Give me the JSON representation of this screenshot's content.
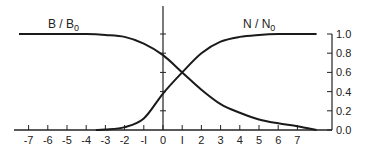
{
  "chart_data": {
    "type": "line",
    "title": "",
    "xlabel": "",
    "ylabel": "",
    "x_ticks": [
      -7,
      -6,
      -5,
      -4,
      -3,
      -2,
      -1,
      0,
      1,
      2,
      3,
      4,
      5,
      6,
      7
    ],
    "x_tick_labels": [
      "-7",
      "-6",
      "-5",
      "-4",
      "-3",
      "-2",
      "-I",
      "0",
      "I",
      "2",
      "3",
      "4",
      "5",
      "6",
      "7"
    ],
    "y_ticks": [
      0.0,
      0.2,
      0.4,
      0.6,
      0.8,
      1.0
    ],
    "y_tick_labels": [
      "0.0",
      "0.2",
      "0.4",
      "0.6",
      "0.8",
      "1.0"
    ],
    "xlim": [
      -7.5,
      8.3
    ],
    "ylim": [
      0,
      1.0
    ],
    "grid": false,
    "legend_position": "inline-labels",
    "series": [
      {
        "name": "B/B0",
        "label_main": "B / B",
        "label_sub": "0",
        "x": [
          -7.5,
          -7,
          -6,
          -5,
          -4,
          -3,
          -2,
          -1,
          0,
          1,
          2,
          3,
          4,
          5,
          6,
          7,
          8
        ],
        "values": [
          1.0,
          1.0,
          1.0,
          1.0,
          1.0,
          0.99,
          0.97,
          0.9,
          0.78,
          0.6,
          0.42,
          0.27,
          0.18,
          0.11,
          0.07,
          0.04,
          0.0
        ]
      },
      {
        "name": "N/N0",
        "label_main": "N / N",
        "label_sub": "0",
        "x": [
          -3.5,
          -3,
          -2,
          -1,
          0,
          1,
          2,
          3,
          4,
          5,
          6,
          7,
          8
        ],
        "values": [
          0.0,
          0.005,
          0.03,
          0.12,
          0.38,
          0.6,
          0.8,
          0.92,
          0.97,
          0.99,
          1.0,
          1.0,
          1.0
        ]
      }
    ]
  }
}
